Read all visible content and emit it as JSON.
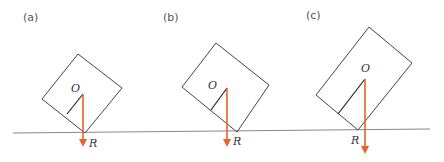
{
  "panels": [
    {
      "label": "(a)",
      "center_label": "O",
      "contact_label": "R"
    },
    {
      "label": "(b)",
      "center_label": "O",
      "contact_label": "R"
    },
    {
      "label": "(c)",
      "center_label": "O",
      "contact_label": "R"
    }
  ],
  "colors": {
    "arrow": "#e8632a",
    "box": "#444444",
    "ground": "#888888"
  }
}
